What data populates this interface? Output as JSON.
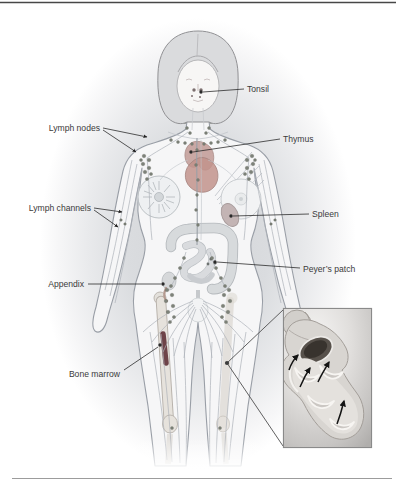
{
  "figure": {
    "labels": {
      "tonsil": "Tonsil",
      "lymph_nodes": "Lymph nodes",
      "thymus": "Thymus",
      "lymph_channels": "Lymph channels",
      "spleen": "Spleen",
      "peyers_patch": "Peyer’s patch",
      "appendix": "Appendix",
      "bone_marrow": "Bone marrow"
    }
  },
  "colors": {
    "page_background": "#ffffff",
    "rule_top": "#474747",
    "rule_bottom": "#9c9c9c",
    "label_text": "#3b3b3b",
    "leader_line": "#222222",
    "body_outline": "#999ea6",
    "body_fill": "#f6f6f7",
    "halo_gray": "#d4d6d9",
    "hair_fill": "#dadbdd",
    "thymus": "#c9a8a4",
    "heart": "#c2938c",
    "spleen": "#c3b4b4",
    "bone_marrow": "#6e4348",
    "lymph_node": "#7d8279",
    "channel_line": "#adb2b9",
    "inset_border": "#8a8a8a",
    "flow_arrow": "#141414"
  }
}
